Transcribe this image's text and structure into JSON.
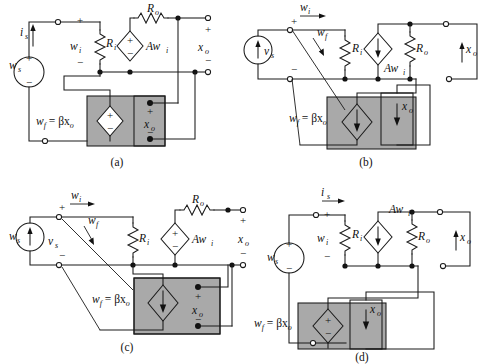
{
  "figure": {
    "background_color": "#ffffff",
    "line_color": "#1a1a1a",
    "shade_color": "#a9a9a9",
    "panel_count": 4
  },
  "panels": [
    {
      "id": "a",
      "caption": "(a)",
      "topology": "series-shunt",
      "source": {
        "type": "voltage-source",
        "symbol": "circle-plus-minus",
        "label": "w",
        "sub": "s",
        "plus": "+",
        "minus": "−"
      },
      "input_current": {
        "label": "i",
        "sub": "s",
        "direction": "up"
      },
      "input_voltage": {
        "label": "w",
        "sub": "i",
        "plus": "+",
        "minus": "−"
      },
      "input_resistor": {
        "label": "R",
        "sub": "i"
      },
      "dependent_source": {
        "kind": "voltage-controlled-voltage-source",
        "symbol": "diamond-plus-minus",
        "label": "Aw",
        "sub": "i"
      },
      "output_resistor": {
        "label": "R",
        "sub": "o",
        "position": "series"
      },
      "output": {
        "label": "x",
        "sub": "o",
        "plus": "+",
        "minus": "−",
        "sense": "voltage"
      },
      "feedback": {
        "equation": "w",
        "equation_sub": "f",
        "equation_rest": " = βx",
        "equation_rest_sub": "o",
        "source_symbol": "diamond-plus-minus",
        "sense_label": "x",
        "sense_sub": "o",
        "sense_plus": "+",
        "sense_minus": "−",
        "sense_type": "voltage-terminals"
      }
    },
    {
      "id": "b",
      "caption": "(b)",
      "topology": "shunt-series",
      "source": {
        "type": "current-source",
        "symbol": "circle-arrow-up",
        "label": "v",
        "sub": "s",
        "plus": "+",
        "minus": "−"
      },
      "input_current": {
        "label": "w",
        "sub": "i",
        "direction": "right"
      },
      "input_voltage": {
        "label": "w",
        "sub": "f",
        "direction": "down-right"
      },
      "input_resistor": {
        "label": "R",
        "sub": "i"
      },
      "dependent_source": {
        "kind": "current-controlled-current-source",
        "symbol": "diamond-arrow-down",
        "label": "Aw",
        "sub": "i"
      },
      "output_resistor": {
        "label": "R",
        "sub": "o",
        "position": "shunt"
      },
      "output": {
        "label": "x",
        "sub": "o",
        "direction": "up",
        "sense": "current"
      },
      "feedback": {
        "equation": "w",
        "equation_sub": "f",
        "equation_rest": " = βx",
        "equation_rest_sub": "o",
        "source_symbol": "diamond-arrow-down",
        "sense_label": "x",
        "sense_sub": "o",
        "sense_type": "current-arrow-down"
      }
    },
    {
      "id": "c",
      "caption": "(c)",
      "topology": "shunt-shunt",
      "source": {
        "type": "current-source",
        "symbol": "circle-arrow-up",
        "label": "w",
        "sub": "s",
        "inner_label": "v",
        "inner_sub": "s",
        "plus": "+",
        "minus": "−"
      },
      "input_current": {
        "label": "w",
        "sub": "i",
        "direction": "right"
      },
      "input_voltage": {
        "label": "w",
        "sub": "f",
        "direction": "down-right"
      },
      "input_resistor": {
        "label": "R",
        "sub": "i"
      },
      "dependent_source": {
        "kind": "voltage-controlled-voltage-source",
        "symbol": "diamond-plus-minus",
        "label": "Aw",
        "sub": "i"
      },
      "output_resistor": {
        "label": "R",
        "sub": "o",
        "position": "series"
      },
      "output": {
        "label": "x",
        "sub": "o",
        "plus": "+",
        "minus": "−",
        "sense": "voltage"
      },
      "feedback": {
        "equation": "w",
        "equation_sub": "f",
        "equation_rest": " = βx",
        "equation_rest_sub": "o",
        "source_symbol": "diamond-arrow-down",
        "sense_label": "x",
        "sense_sub": "o",
        "sense_plus": "+",
        "sense_minus": "−",
        "sense_type": "voltage-terminals"
      }
    },
    {
      "id": "d",
      "caption": "(d)",
      "topology": "series-series",
      "source": {
        "type": "voltage-source",
        "symbol": "circle-plus-minus",
        "label": "w",
        "sub": "s",
        "plus": "+",
        "minus": "−"
      },
      "input_current": {
        "label": "i",
        "sub": "s",
        "direction": "right"
      },
      "input_voltage": {
        "label": "w",
        "sub": "i",
        "plus": "+",
        "minus": "−"
      },
      "input_resistor": {
        "label": "R",
        "sub": "i"
      },
      "dependent_source": {
        "kind": "current-controlled-current-source",
        "symbol": "diamond-arrow-down",
        "label": "Aw",
        "sub": "i"
      },
      "output_resistor": {
        "label": "R",
        "sub": "o",
        "position": "shunt"
      },
      "output": {
        "label": "x",
        "sub": "o",
        "direction": "up",
        "sense": "current"
      },
      "feedback": {
        "equation": "w",
        "equation_sub": "f",
        "equation_rest": " = βx",
        "equation_rest_sub": "o",
        "source_symbol": "diamond-plus-minus",
        "sense_label": "x",
        "sense_sub": "o",
        "sense_type": "current-arrow-down"
      }
    }
  ]
}
